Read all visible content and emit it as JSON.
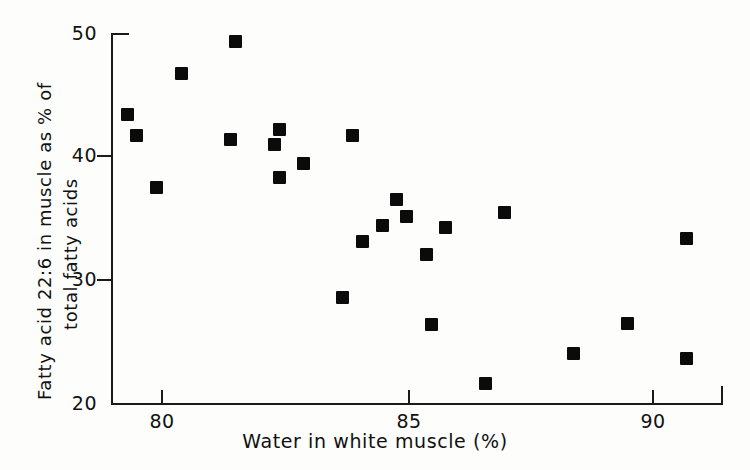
{
  "chart_data": {
    "type": "scatter",
    "title": "",
    "xlabel": "Water in white muscle (%)",
    "ylabel": "Fatty acid 22:6 in muscle as % of total fatty acids",
    "ylabel_line1": "Fatty acid 22:6 in muscle as % of",
    "ylabel_line2": "total fatty acids",
    "xlim": [
      79.0,
      91.5
    ],
    "ylim": [
      20,
      50
    ],
    "xticks": [
      80,
      85,
      90
    ],
    "xticklabels": [
      "80",
      "85",
      "90"
    ],
    "yticks": [
      20,
      30,
      40,
      50
    ],
    "yticklabels": [
      "20",
      "30",
      "40",
      "50"
    ],
    "grid": false,
    "legend": null,
    "marker": "filled-square",
    "marker_color": "#0b0b0b",
    "series": [
      {
        "name": "samples",
        "points": [
          {
            "x": 79.3,
            "y": 43.4
          },
          {
            "x": 79.5,
            "y": 41.7
          },
          {
            "x": 79.9,
            "y": 37.5
          },
          {
            "x": 80.4,
            "y": 46.8
          },
          {
            "x": 81.4,
            "y": 41.4
          },
          {
            "x": 81.5,
            "y": 49.4
          },
          {
            "x": 82.3,
            "y": 41.0
          },
          {
            "x": 82.4,
            "y": 42.2
          },
          {
            "x": 82.4,
            "y": 38.3
          },
          {
            "x": 82.9,
            "y": 39.4
          },
          {
            "x": 83.7,
            "y": 28.5
          },
          {
            "x": 83.9,
            "y": 41.7
          },
          {
            "x": 84.1,
            "y": 33.1
          },
          {
            "x": 84.5,
            "y": 34.4
          },
          {
            "x": 84.8,
            "y": 36.5
          },
          {
            "x": 85.0,
            "y": 35.1
          },
          {
            "x": 85.4,
            "y": 32.0
          },
          {
            "x": 85.5,
            "y": 26.3
          },
          {
            "x": 85.8,
            "y": 34.2
          },
          {
            "x": 86.6,
            "y": 21.5
          },
          {
            "x": 87.0,
            "y": 35.4
          },
          {
            "x": 88.4,
            "y": 23.9
          },
          {
            "x": 89.5,
            "y": 26.4
          },
          {
            "x": 90.7,
            "y": 33.3
          },
          {
            "x": 90.7,
            "y": 23.5
          }
        ]
      }
    ]
  },
  "axes": {
    "y_tick_labels": [
      "50",
      "40",
      "30",
      "20"
    ],
    "x_tick_labels": [
      "80",
      "85",
      "90"
    ]
  }
}
